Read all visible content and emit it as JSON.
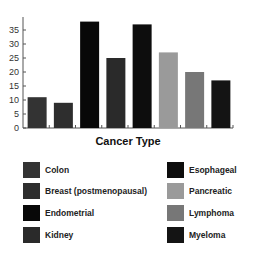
{
  "chart_data": {
    "type": "bar",
    "title": "",
    "xlabel": "Cancer Type",
    "ylabel": "",
    "ylim": [
      0,
      39
    ],
    "yticks": [
      0,
      5,
      10,
      15,
      20,
      25,
      30,
      35
    ],
    "grid": false,
    "legend_position": "bottom",
    "categories": [
      "Colon",
      "Breast (postmenopausal)",
      "Endometrial",
      "Kidney",
      "Esophageal",
      "Pancreatic",
      "Lymphoma",
      "Myeloma"
    ],
    "values": [
      11,
      9,
      38,
      25,
      37,
      27,
      20,
      17
    ],
    "colors": [
      "#333333",
      "#2e2e2e",
      "#080808",
      "#2a2a2a",
      "#0d0d0d",
      "#9a9a9a",
      "#777777",
      "#141414"
    ]
  },
  "legend": {
    "left": [
      {
        "label": "Colon",
        "color": "#333333"
      },
      {
        "label": "Breast (postmenopausal)",
        "color": "#2e2e2e"
      },
      {
        "label": "Endometrial",
        "color": "#080808"
      },
      {
        "label": "Kidney",
        "color": "#2a2a2a"
      }
    ],
    "right": [
      {
        "label": "Esophageal",
        "color": "#0d0d0d"
      },
      {
        "label": "Pancreatic",
        "color": "#9a9a9a"
      },
      {
        "label": "Lymphoma",
        "color": "#777777"
      },
      {
        "label": "Myeloma",
        "color": "#141414"
      }
    ]
  }
}
